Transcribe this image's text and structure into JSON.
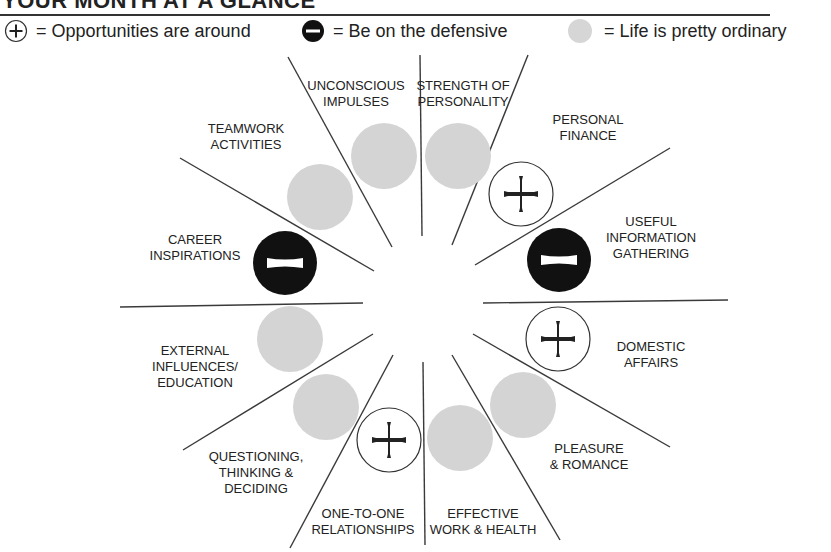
{
  "header": {
    "title": "YOUR MONTH AT A GLANCE"
  },
  "legend": {
    "items": [
      {
        "symbol": "plus-circle-icon",
        "text": "= Opportunities are around"
      },
      {
        "symbol": "minus-circle-icon",
        "text": "= Be on the defensive"
      },
      {
        "symbol": "grey-dot-icon",
        "text": "= Life is pretty ordinary"
      }
    ]
  },
  "colors": {
    "line": "#3a3a3a",
    "ordinary_fill": "#d4d4d4",
    "defensive_fill": "#111111",
    "opportunity_stroke": "#222222",
    "text": "#222222"
  },
  "wheel": {
    "sectors": [
      {
        "label_lines": [
          "STRENGTH OF",
          "PERSONALITY"
        ],
        "status": "ordinary"
      },
      {
        "label_lines": [
          "PERSONAL",
          "FINANCE"
        ],
        "status": "opportunity"
      },
      {
        "label_lines": [
          "USEFUL",
          "INFORMATION",
          "GATHERING"
        ],
        "status": "defensive"
      },
      {
        "label_lines": [
          "DOMESTIC",
          "AFFAIRS"
        ],
        "status": "opportunity"
      },
      {
        "label_lines": [
          "PLEASURE",
          "& ROMANCE"
        ],
        "status": "ordinary"
      },
      {
        "label_lines": [
          "EFFECTIVE",
          "WORK & HEALTH"
        ],
        "status": "ordinary"
      },
      {
        "label_lines": [
          "ONE-TO-ONE",
          "RELATIONSHIPS"
        ],
        "status": "opportunity"
      },
      {
        "label_lines": [
          "QUESTIONING,",
          "THINKING &",
          "DECIDING"
        ],
        "status": "ordinary"
      },
      {
        "label_lines": [
          "EXTERNAL",
          "INFLUENCES/",
          "EDUCATION"
        ],
        "status": "ordinary"
      },
      {
        "label_lines": [
          "CAREER",
          "INSPIRATIONS"
        ],
        "status": "defensive"
      },
      {
        "label_lines": [
          "TEAMWORK",
          "ACTIVITIES"
        ],
        "status": "ordinary"
      },
      {
        "label_lines": [
          "UNCONSCIOUS",
          "IMPULSES"
        ],
        "status": "ordinary"
      }
    ]
  }
}
